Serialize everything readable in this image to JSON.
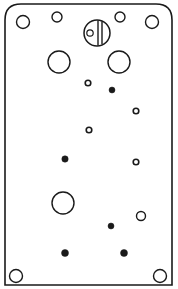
{
  "diagram": {
    "stroke_color": "#1a1a1a",
    "fill_color": "#ffffff",
    "plate": {
      "x": 5,
      "y": 4,
      "width": 167,
      "height": 281,
      "top_corner_radius": 16
    },
    "screw": {
      "cx": 97,
      "cy": 33,
      "r": 13,
      "slot_x1": 98,
      "slot_x2": 102,
      "small_hole": {
        "cx": 90,
        "cy": 33,
        "r": 3.2
      }
    },
    "open_holes": [
      {
        "id": "corner-top-left",
        "cx": 23,
        "cy": 22,
        "r": 6.5
      },
      {
        "id": "top-small-left",
        "cx": 57,
        "cy": 17,
        "r": 5
      },
      {
        "id": "top-small-right",
        "cx": 120,
        "cy": 17,
        "r": 5
      },
      {
        "id": "corner-top-right",
        "cx": 152,
        "cy": 22,
        "r": 6.5
      },
      {
        "id": "large-left",
        "cx": 59,
        "cy": 62,
        "r": 11
      },
      {
        "id": "large-right",
        "cx": 119,
        "cy": 62,
        "r": 11
      },
      {
        "id": "small-1",
        "cx": 88,
        "cy": 83,
        "r": 2.8
      },
      {
        "id": "small-2",
        "cx": 136,
        "cy": 111,
        "r": 2.8
      },
      {
        "id": "small-3",
        "cx": 89,
        "cy": 130,
        "r": 2.8
      },
      {
        "id": "small-4",
        "cx": 136,
        "cy": 162,
        "r": 2.8
      },
      {
        "id": "large-bottom",
        "cx": 63,
        "cy": 203,
        "r": 11
      },
      {
        "id": "medium-right",
        "cx": 141,
        "cy": 216,
        "r": 4.5
      },
      {
        "id": "corner-bottom-left",
        "cx": 16,
        "cy": 276,
        "r": 6.5
      },
      {
        "id": "corner-bottom-right",
        "cx": 160,
        "cy": 276,
        "r": 6.5
      }
    ],
    "filled_holes": [
      {
        "id": "dot-1",
        "cx": 112,
        "cy": 90,
        "r": 3
      },
      {
        "id": "dot-2",
        "cx": 65,
        "cy": 159,
        "r": 3.2
      },
      {
        "id": "dot-3",
        "cx": 111,
        "cy": 226,
        "r": 3
      },
      {
        "id": "dot-4",
        "cx": 65,
        "cy": 253,
        "r": 3.5
      },
      {
        "id": "dot-5",
        "cx": 124,
        "cy": 253,
        "r": 3.5
      }
    ]
  }
}
